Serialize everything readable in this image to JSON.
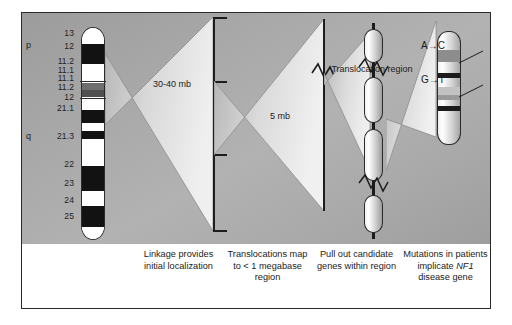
{
  "figure": {
    "background_color": "#a8a8a8",
    "border_color": "#2a2a2a"
  },
  "chromosome": {
    "name": "chromosome-17-ideogram",
    "number_label": "17",
    "arm_labels": {
      "p": "p",
      "q": "q"
    },
    "band_labels": [
      "13",
      "12",
      "11.2",
      "11.1",
      "11.1",
      "11.2",
      "12",
      "21.1",
      "21.3",
      "22",
      "23",
      "24",
      "25"
    ],
    "bands": [
      {
        "label": "13",
        "color": "#ffffff",
        "top": 0,
        "height": 16
      },
      {
        "label": "12",
        "color": "#121212",
        "top": 16,
        "height": 20
      },
      {
        "label": "11.2",
        "color": "#ffffff",
        "top": 36,
        "height": 19
      },
      {
        "label": "11.1",
        "color": "#6e6e6e",
        "top": 55,
        "height": 7
      },
      {
        "label": "11.1",
        "color": "#555555",
        "top": 62,
        "height": 7
      },
      {
        "label": "11.2",
        "color": "#ffffff",
        "top": 69,
        "height": 13
      },
      {
        "label": "12",
        "color": "#121212",
        "top": 82,
        "height": 13
      },
      {
        "label": "21.1",
        "color": "#ffffff",
        "top": 95,
        "height": 8
      },
      {
        "label": "21.2",
        "color": "#121212",
        "top": 103,
        "height": 8
      },
      {
        "label": "21.3",
        "color": "#ffffff",
        "top": 111,
        "height": 27
      },
      {
        "label": "22",
        "color": "#121212",
        "top": 138,
        "height": 25
      },
      {
        "label": "23",
        "color": "#ffffff",
        "top": 163,
        "height": 15
      },
      {
        "label": "24",
        "color": "#121212",
        "top": 178,
        "height": 21
      },
      {
        "label": "25",
        "color": "#ffffff",
        "top": 199,
        "height": 14
      }
    ]
  },
  "panels": {
    "linkage": {
      "scale_label": "30-40 mb",
      "caption": "Linkage provides initial localization"
    },
    "translocation": {
      "scale_label": "5 mb",
      "caption": "Translocations map to < 1 megabase region"
    },
    "genes": {
      "region_label": "Translocation region",
      "caption": "Pull out candidate genes within region"
    },
    "mutations": {
      "caption_line1": "Mutations in patients implicate ",
      "gene_name": "NF1",
      "caption_line2": " disease gene"
    }
  },
  "mutations": [
    {
      "name": "mutation-a-to-c",
      "from": "A",
      "arrow": "→",
      "to": "C",
      "label": "A→C"
    },
    {
      "name": "mutation-g-to-t",
      "from": "G",
      "arrow": "→",
      "to": "T",
      "label": "G→T"
    }
  ],
  "captions": [
    "Linkage provides initial localization",
    "Translocations map to < 1 megabase region",
    "Pull out candidate genes within region",
    "Mutations in patients implicate NF1 disease gene"
  ]
}
